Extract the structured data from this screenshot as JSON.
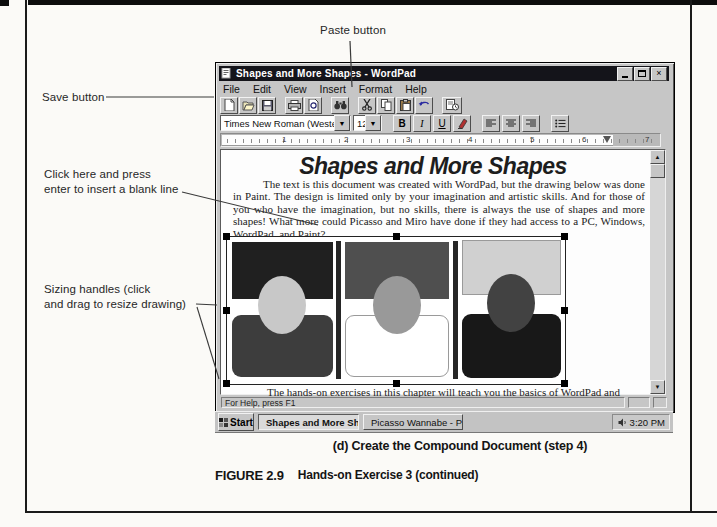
{
  "annotations": {
    "paste_label": "Paste button",
    "save_label": "Save button",
    "click_line1": "Click here and press",
    "click_line2": "enter to insert a blank line",
    "sizing_line1": "Sizing handles (click",
    "sizing_line2": "and drag to resize drawing)"
  },
  "wordpad": {
    "title": "Shapes and More Shapes - WordPad",
    "window_controls": {
      "close": "×"
    },
    "menu": {
      "items": [
        "File",
        "Edit",
        "View",
        "Insert",
        "Format",
        "Help"
      ]
    },
    "toolbar": {
      "icons": [
        "new-document",
        "open-folder",
        "save-floppy",
        "print",
        "print-preview",
        "find",
        "cut",
        "copy",
        "paste",
        "undo",
        "date-time"
      ]
    },
    "formatbar": {
      "font_name": "Times New Roman (Western)",
      "font_size": "12",
      "bold": "B",
      "italic": "I",
      "underline": "U",
      "icons": [
        "font-color",
        "align-left",
        "align-center",
        "align-right",
        "bullets"
      ]
    },
    "ruler": {
      "numbers": [
        "1",
        "2",
        "3",
        "4",
        "5",
        "6",
        "7"
      ]
    },
    "document": {
      "heading": "Shapes and More Shapes",
      "body": "The text is this document was created with WordPad, but the drawing below was done in Paint.  The design is limited only by your imagination and artistic skills.  And for those of you who have the imagination, but no skills, there is always the use of shapes and more shapes!  What more could Picasso and Miro have done if they had access to a PC, Windows, WordPad, and Paint?",
      "closing": "The hands-on exercises in this chapter will teach you the basics of WordPad and"
    },
    "scrollbar": {
      "up": "▲",
      "down": "▼"
    },
    "statusbar": {
      "text": "For Help, press F1"
    }
  },
  "taskbar": {
    "start_label": "Start",
    "tasks": [
      {
        "label": "Shapes and More Sh...",
        "icon": "wordpad-document"
      },
      {
        "label": "Picasso Wannabe - Paint",
        "icon": "paint-program"
      }
    ],
    "clock": "3:20 PM"
  },
  "caption": {
    "sub": "(d) Create the Compound Document (step 4)",
    "figure_number": "FIGURE 2.9",
    "figure_title": "Hands-on Exercise 3 (continued)"
  },
  "colors": {
    "titlebar": "#14141a",
    "window_chrome": "#c6c6c6",
    "shape_black": "#202020",
    "shape_dark_gray": "#3d3d3d",
    "shape_mid_gray": "#999999",
    "shape_light_gray": "#c8c8c8"
  }
}
